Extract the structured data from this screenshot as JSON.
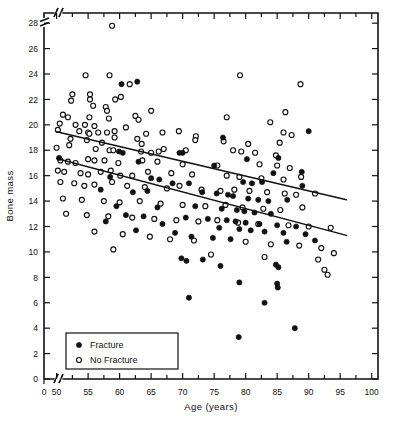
{
  "chart_data": {
    "type": "scatter",
    "title": "",
    "xlabel": "Age (years)",
    "ylabel": "Bone mass",
    "xlim": [
      48,
      101
    ],
    "ylim": [
      0,
      28.8
    ],
    "axis_break_x": true,
    "axis_break_y": true,
    "grid": false,
    "x_ticks": [
      50,
      55,
      60,
      65,
      70,
      75,
      80,
      85,
      90,
      95,
      100
    ],
    "x_tick_labels": [
      "50",
      "55",
      "60",
      "65",
      "70",
      "75",
      "80",
      "85",
      "90",
      "95",
      "100"
    ],
    "x_origin_label": "0",
    "x_minor_ticks": [
      52.5,
      57.5,
      62.5,
      67.5,
      72.5,
      77.5,
      82.5,
      87.5,
      92.5,
      97.5
    ],
    "y_ticks": [
      0,
      2,
      4,
      6,
      8,
      10,
      12,
      14,
      16,
      18,
      20,
      22,
      24,
      26,
      28
    ],
    "y_tick_labels": [
      "0",
      "2",
      "4",
      "6",
      "8",
      "10",
      "12",
      "14",
      "16",
      "18",
      "20",
      "22",
      "24",
      "26",
      "28"
    ],
    "legend_position": "bottom-left",
    "legend": [
      {
        "marker": "filled-circle",
        "label": "Fracture"
      },
      {
        "marker": "open-circle",
        "label": "No Fracture"
      }
    ],
    "series": [
      {
        "name": "No Fracture",
        "marker": "open-circle",
        "color": "#111111",
        "points": [
          [
            58.8,
            27.8
          ],
          [
            54.6,
            23.9
          ],
          [
            58.4,
            23.9
          ],
          [
            79.1,
            23.9
          ],
          [
            61.6,
            23.2
          ],
          [
            88.7,
            23.2
          ],
          [
            52.5,
            22.4
          ],
          [
            55.3,
            22.4
          ],
          [
            55.3,
            22.0
          ],
          [
            52.3,
            21.9
          ],
          [
            60.2,
            22.2
          ],
          [
            59.3,
            22.0
          ],
          [
            55.8,
            21.5
          ],
          [
            57.8,
            21.4
          ],
          [
            58.0,
            21.1
          ],
          [
            65.0,
            21.1
          ],
          [
            86.3,
            21.0
          ],
          [
            51.0,
            20.8
          ],
          [
            51.8,
            20.6
          ],
          [
            55.2,
            20.6
          ],
          [
            58.3,
            20.5
          ],
          [
            62.5,
            20.7
          ],
          [
            63.0,
            20.4
          ],
          [
            77.0,
            20.6
          ],
          [
            50.5,
            20.1
          ],
          [
            53.0,
            20.0
          ],
          [
            54.5,
            20.0
          ],
          [
            56.0,
            19.9
          ],
          [
            61.0,
            19.8
          ],
          [
            83.9,
            20.2
          ],
          [
            50.2,
            19.6
          ],
          [
            53.6,
            19.5
          ],
          [
            55.0,
            19.4
          ],
          [
            55.2,
            19.3
          ],
          [
            56.6,
            19.4
          ],
          [
            58.0,
            19.4
          ],
          [
            59.2,
            19.5
          ],
          [
            59.2,
            19.0
          ],
          [
            64.2,
            19.3
          ],
          [
            66.8,
            19.4
          ],
          [
            69.4,
            19.5
          ],
          [
            72.1,
            19.1
          ],
          [
            86.0,
            19.4
          ],
          [
            87.3,
            19.2
          ],
          [
            52.2,
            18.9
          ],
          [
            54.8,
            18.8
          ],
          [
            57.2,
            18.6
          ],
          [
            62.8,
            18.9
          ],
          [
            63.5,
            18.5
          ],
          [
            72.0,
            18.8
          ],
          [
            76.5,
            18.7
          ],
          [
            80.4,
            18.5
          ],
          [
            85.4,
            18.6
          ],
          [
            50.0,
            18.2
          ],
          [
            52.0,
            18.4
          ],
          [
            56.2,
            18.1
          ],
          [
            58.4,
            18.0
          ],
          [
            59.0,
            18.0
          ],
          [
            63.4,
            17.9
          ],
          [
            65.0,
            17.8
          ],
          [
            66.2,
            17.9
          ],
          [
            67.0,
            18.1
          ],
          [
            70.5,
            18.0
          ],
          [
            78.0,
            18.0
          ],
          [
            79.3,
            17.9
          ],
          [
            81.5,
            17.8
          ],
          [
            84.8,
            17.6
          ],
          [
            50.6,
            17.2
          ],
          [
            51.8,
            17.1
          ],
          [
            53.0,
            17.0
          ],
          [
            55.0,
            17.3
          ],
          [
            56.0,
            17.2
          ],
          [
            57.6,
            17.2
          ],
          [
            59.8,
            17.0
          ],
          [
            63.6,
            17.2
          ],
          [
            66.0,
            17.1
          ],
          [
            70.0,
            16.9
          ],
          [
            75.5,
            16.8
          ],
          [
            82.2,
            16.9
          ],
          [
            85.0,
            16.8
          ],
          [
            87.0,
            16.6
          ],
          [
            50.2,
            16.4
          ],
          [
            51.2,
            16.3
          ],
          [
            53.8,
            16.2
          ],
          [
            55.0,
            16.1
          ],
          [
            57.0,
            16.3
          ],
          [
            58.6,
            16.4
          ],
          [
            60.1,
            16.0
          ],
          [
            62.0,
            16.0
          ],
          [
            64.5,
            16.3
          ],
          [
            68.2,
            16.2
          ],
          [
            71.5,
            16.1
          ],
          [
            77.0,
            16.0
          ],
          [
            79.0,
            15.9
          ],
          [
            82.5,
            15.8
          ],
          [
            86.0,
            15.7
          ],
          [
            88.8,
            15.9
          ],
          [
            50.6,
            15.5
          ],
          [
            52.8,
            15.4
          ],
          [
            54.4,
            15.2
          ],
          [
            56.0,
            15.3
          ],
          [
            58.8,
            15.5
          ],
          [
            61.2,
            15.2
          ],
          [
            64.0,
            15.1
          ],
          [
            67.5,
            15.0
          ],
          [
            69.5,
            15.2
          ],
          [
            73.0,
            14.9
          ],
          [
            76.0,
            14.8
          ],
          [
            78.2,
            14.9
          ],
          [
            80.6,
            14.8
          ],
          [
            83.4,
            14.7
          ],
          [
            86.2,
            14.6
          ],
          [
            88.0,
            14.5
          ],
          [
            91.0,
            14.6
          ],
          [
            51.0,
            14.2
          ],
          [
            54.0,
            14.1
          ],
          [
            57.5,
            14.0
          ],
          [
            60.0,
            13.9
          ],
          [
            63.2,
            14.0
          ],
          [
            66.5,
            13.8
          ],
          [
            70.0,
            13.7
          ],
          [
            73.6,
            13.6
          ],
          [
            76.8,
            13.7
          ],
          [
            79.5,
            13.5
          ],
          [
            82.8,
            13.4
          ],
          [
            85.5,
            13.3
          ],
          [
            89.0,
            13.5
          ],
          [
            51.5,
            13.0
          ],
          [
            54.8,
            12.9
          ],
          [
            58.2,
            12.8
          ],
          [
            62.0,
            12.7
          ],
          [
            65.5,
            12.6
          ],
          [
            69.0,
            12.5
          ],
          [
            72.5,
            12.4
          ],
          [
            75.5,
            12.5
          ],
          [
            78.8,
            12.3
          ],
          [
            82.0,
            12.2
          ],
          [
            86.8,
            12.1
          ],
          [
            90.0,
            12.0
          ],
          [
            93.5,
            11.9
          ],
          [
            56.0,
            11.6
          ],
          [
            60.5,
            11.4
          ],
          [
            64.8,
            11.2
          ],
          [
            68.0,
            11.0
          ],
          [
            71.8,
            10.9
          ],
          [
            80.0,
            10.8
          ],
          [
            84.0,
            10.6
          ],
          [
            88.5,
            10.5
          ],
          [
            92.0,
            10.3
          ],
          [
            94.0,
            9.9
          ],
          [
            59.0,
            10.2
          ],
          [
            74.5,
            9.8
          ],
          [
            83.0,
            9.6
          ],
          [
            91.5,
            9.4
          ],
          [
            92.5,
            8.6
          ],
          [
            93.0,
            8.2
          ]
        ]
      },
      {
        "name": "Fracture",
        "marker": "filled-circle",
        "color": "#111111",
        "points": [
          [
            60.3,
            23.2
          ],
          [
            62.8,
            23.4
          ],
          [
            76.4,
            19.0
          ],
          [
            90.0,
            19.5
          ],
          [
            50.4,
            17.4
          ],
          [
            59.9,
            17.9
          ],
          [
            60.5,
            17.8
          ],
          [
            63.0,
            17.1
          ],
          [
            69.5,
            17.8
          ],
          [
            70.0,
            17.8
          ],
          [
            80.2,
            17.3
          ],
          [
            85.2,
            17.4
          ],
          [
            75.0,
            16.8
          ],
          [
            84.4,
            16.2
          ],
          [
            88.9,
            16.3
          ],
          [
            58.5,
            15.9
          ],
          [
            65.0,
            15.8
          ],
          [
            66.3,
            15.7
          ],
          [
            68.4,
            15.4
          ],
          [
            71.0,
            15.4
          ],
          [
            79.6,
            15.5
          ],
          [
            81.0,
            15.4
          ],
          [
            82.6,
            15.5
          ],
          [
            89.0,
            15.2
          ],
          [
            57.0,
            14.9
          ],
          [
            62.1,
            14.7
          ],
          [
            64.4,
            14.8
          ],
          [
            73.1,
            14.7
          ],
          [
            75.4,
            14.6
          ],
          [
            77.2,
            14.5
          ],
          [
            78.0,
            14.4
          ],
          [
            80.4,
            14.2
          ],
          [
            82.0,
            14.1
          ],
          [
            83.6,
            14.0
          ],
          [
            86.6,
            14.1
          ],
          [
            59.5,
            13.6
          ],
          [
            66.0,
            13.5
          ],
          [
            72.0,
            13.6
          ],
          [
            76.2,
            13.4
          ],
          [
            78.6,
            13.3
          ],
          [
            79.8,
            13.2
          ],
          [
            81.4,
            13.1
          ],
          [
            84.0,
            13.0
          ],
          [
            61.0,
            12.9
          ],
          [
            63.8,
            12.8
          ],
          [
            70.5,
            12.7
          ],
          [
            74.0,
            12.6
          ],
          [
            77.0,
            12.5
          ],
          [
            78.4,
            12.4
          ],
          [
            80.0,
            12.3
          ],
          [
            82.2,
            12.2
          ],
          [
            85.0,
            12.1
          ],
          [
            88.0,
            12.0
          ],
          [
            57.8,
            12.4
          ],
          [
            66.8,
            12.2
          ],
          [
            75.8,
            11.9
          ],
          [
            79.0,
            11.8
          ],
          [
            80.8,
            11.7
          ],
          [
            83.0,
            11.6
          ],
          [
            86.0,
            11.5
          ],
          [
            89.5,
            11.4
          ],
          [
            62.6,
            11.7
          ],
          [
            68.8,
            11.5
          ],
          [
            71.4,
            11.2
          ],
          [
            74.8,
            11.1
          ],
          [
            77.6,
            11.0
          ],
          [
            86.5,
            10.8
          ],
          [
            91.0,
            10.9
          ],
          [
            69.8,
            9.5
          ],
          [
            70.6,
            9.3
          ],
          [
            73.2,
            9.4
          ],
          [
            76.0,
            8.9
          ],
          [
            84.8,
            9.0
          ],
          [
            85.2,
            8.8
          ],
          [
            79.0,
            7.6
          ],
          [
            85.0,
            7.5
          ],
          [
            85.1,
            7.2
          ],
          [
            71.0,
            6.4
          ],
          [
            83.0,
            6.0
          ],
          [
            78.9,
            3.3
          ],
          [
            87.8,
            4.0
          ]
        ]
      }
    ],
    "regression_lines": [
      {
        "name": "no-fracture-fit",
        "x0": 50.0,
        "y0": 19.45,
        "x1": 96.0,
        "y1": 14.1
      },
      {
        "name": "fracture-fit",
        "x0": 50.0,
        "y0": 17.35,
        "x1": 96.0,
        "y1": 11.3
      }
    ]
  }
}
